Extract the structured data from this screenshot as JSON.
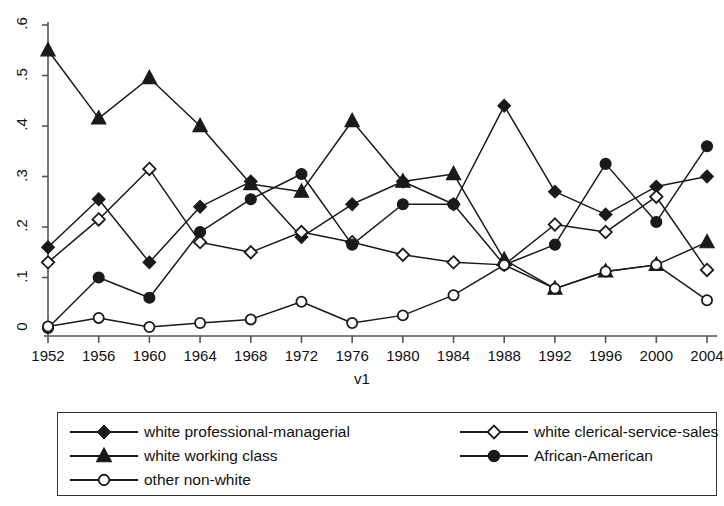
{
  "chart_data": {
    "type": "line",
    "title": "",
    "subtitle": "",
    "xlabel": "v1",
    "ylabel": "",
    "grid": false,
    "legend_position": "bottom",
    "x": [
      1952,
      1956,
      1960,
      1964,
      1968,
      1972,
      1976,
      1980,
      1984,
      1988,
      1992,
      1996,
      2000,
      2004
    ],
    "categories": [
      "1952",
      "1956",
      "1960",
      "1964",
      "1968",
      "1972",
      "1976",
      "1980",
      "1984",
      "1988",
      "1992",
      "1996",
      "2000",
      "2004"
    ],
    "xlim": [
      1952,
      2004
    ],
    "ylim": [
      0,
      0.6
    ],
    "ytick_labels": [
      "0",
      ".1",
      ".2",
      ".3",
      ".4",
      ".5",
      ".6"
    ],
    "ytick_values": [
      0,
      0.1,
      0.2,
      0.3,
      0.4,
      0.5,
      0.6
    ],
    "series": [
      {
        "name": "white professional-managerial",
        "marker": "filled-diamond",
        "values": [
          0.16,
          0.255,
          0.13,
          0.24,
          0.29,
          0.18,
          0.245,
          0.29,
          0.245,
          0.44,
          0.27,
          0.225,
          0.28,
          0.3
        ]
      },
      {
        "name": "white clerical-service-sales",
        "marker": "open-diamond",
        "values": [
          0.13,
          0.215,
          0.315,
          0.17,
          0.15,
          0.19,
          0.17,
          0.145,
          0.13,
          0.125,
          0.205,
          0.19,
          0.26,
          0.115
        ]
      },
      {
        "name": "white working class",
        "marker": "filled-triangle",
        "values": [
          0.55,
          0.415,
          0.495,
          0.4,
          0.285,
          0.27,
          0.41,
          0.29,
          0.305,
          0.135,
          0.078,
          0.112,
          0.125,
          0.17
        ]
      },
      {
        "name": "African-American",
        "marker": "filled-circle",
        "values": [
          0.0,
          0.1,
          0.06,
          0.19,
          0.255,
          0.305,
          0.165,
          0.245,
          0.245,
          0.125,
          0.165,
          0.325,
          0.21,
          0.36
        ]
      },
      {
        "name": "other non-white",
        "marker": "open-circle",
        "values": [
          0.003,
          0.02,
          0.002,
          0.01,
          0.017,
          0.052,
          0.01,
          0.025,
          0.065,
          0.125,
          0.078,
          0.112,
          0.125,
          0.055
        ]
      }
    ],
    "colors": {
      "line": "#1a1a1a",
      "marker_fill": "#1a1a1a",
      "marker_open_fill": "#ffffff",
      "axis": "#555555",
      "background": "#ffffff"
    }
  },
  "axis": {
    "x_title": "v1",
    "y_ticks": [
      "0",
      ".1",
      ".2",
      ".3",
      ".4",
      ".5",
      ".6"
    ],
    "x_ticks": [
      "1952",
      "1956",
      "1960",
      "1964",
      "1968",
      "1972",
      "1976",
      "1980",
      "1984",
      "1988",
      "1992",
      "1996",
      "2000",
      "2004"
    ]
  },
  "legend": {
    "entries": [
      {
        "label": "white professional-managerial",
        "marker": "filled-diamond"
      },
      {
        "label": "white clerical-service-sales",
        "marker": "open-diamond"
      },
      {
        "label": "white working class",
        "marker": "filled-triangle"
      },
      {
        "label": "African-American",
        "marker": "filled-circle"
      },
      {
        "label": "other non-white",
        "marker": "open-circle"
      }
    ]
  }
}
